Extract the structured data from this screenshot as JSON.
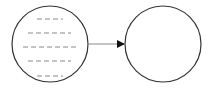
{
  "diagram": {
    "type": "flow",
    "background": "#ffffff",
    "stroke_color": "#333333",
    "dash_color": "#888888",
    "nodes": [
      {
        "id": "source",
        "shape": "circle",
        "cx": 50,
        "cy": 44,
        "r": 38,
        "content": "dashed-text-placeholder-lines",
        "lines": [
          {
            "y": 19,
            "x1": 37,
            "x2": 63
          },
          {
            "y": 33,
            "x1": 28,
            "x2": 71
          },
          {
            "y": 47,
            "x1": 23,
            "x2": 76
          },
          {
            "y": 61,
            "x1": 28,
            "x2": 71
          },
          {
            "y": 76,
            "x1": 37,
            "x2": 63
          }
        ]
      },
      {
        "id": "target",
        "shape": "circle",
        "cx": 163,
        "cy": 44,
        "r": 38,
        "content": "empty"
      }
    ],
    "edges": [
      {
        "from": "source",
        "to": "target",
        "x1": 89,
        "y1": 44,
        "x2": 124,
        "y2": 44,
        "arrowhead": "filled-triangle"
      }
    ]
  }
}
